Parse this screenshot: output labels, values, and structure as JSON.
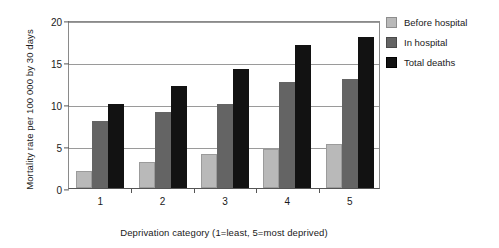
{
  "chart_data": {
    "type": "bar",
    "title": "",
    "xlabel": "Deprivation category (1=least, 5=most deprived)",
    "ylabel": "Mortality rate per 100 000 by 30 days",
    "categories": [
      "1",
      "2",
      "3",
      "4",
      "5"
    ],
    "yticks": [
      0,
      5,
      10,
      15,
      20
    ],
    "ylim": [
      0,
      20
    ],
    "grid": true,
    "legend_position": "right",
    "series": [
      {
        "name": "Before hospital",
        "color": "#b9b9b9",
        "values": [
          2.0,
          3.1,
          4.1,
          4.6,
          5.2
        ]
      },
      {
        "name": "In hospital",
        "color": "#646464",
        "values": [
          8.0,
          9.1,
          10.0,
          12.6,
          13.0
        ]
      },
      {
        "name": "Total deaths",
        "color": "#121212",
        "values": [
          10.0,
          12.2,
          14.2,
          17.0,
          18.0
        ]
      }
    ]
  },
  "legend": {
    "items": [
      {
        "label": "Before hospital"
      },
      {
        "label": "In hospital"
      },
      {
        "label": "Total deaths"
      }
    ]
  }
}
